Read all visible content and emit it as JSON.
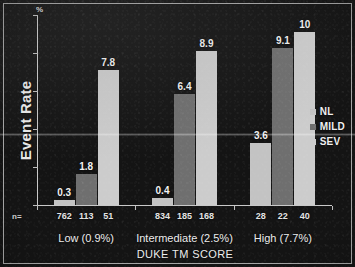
{
  "chart_data": {
    "type": "bar",
    "title": "",
    "xlabel": "DUKE TM SCORE",
    "ylabel": "Event Rate",
    "yunit": "%",
    "categories": [
      "Low (0.9%)",
      "Intermediate (2.5%)",
      "High (7.7%)"
    ],
    "series": [
      {
        "name": "NL",
        "values": [
          0.3,
          0.4,
          3.6
        ],
        "color": "#c3c3c3",
        "counts": [
          762,
          834,
          28
        ]
      },
      {
        "name": "MILD",
        "values": [
          1.8,
          6.4,
          9.1
        ],
        "color": "#6f6f6f",
        "counts": [
          113,
          185,
          22
        ]
      },
      {
        "name": "SEV",
        "values": [
          7.8,
          8.9,
          10
        ],
        "color": "#cccccc",
        "counts": [
          51,
          168,
          40
        ]
      }
    ],
    "value_labels": [
      "0.3",
      "1.8",
      "7.8",
      "0.4",
      "6.4",
      "8.9",
      "3.6",
      "9.1",
      "10"
    ],
    "ylim": [
      0,
      11
    ],
    "grid": false,
    "legend_position": "right",
    "axis_color": "#c9c9c9",
    "background_color": "#141414",
    "text_color": "#ececec"
  },
  "axes": {
    "y_title": "Event Rate",
    "y_unit": "%",
    "x_title": "DUKE TM SCORE"
  },
  "n_row": {
    "label": "n=",
    "groups": [
      {
        "values": [
          "762",
          "113",
          "51"
        ]
      },
      {
        "values": [
          "834",
          "185",
          "168"
        ]
      },
      {
        "values": [
          "28",
          "22",
          "40"
        ]
      }
    ]
  },
  "groups": [
    {
      "label": "Low (0.9%)"
    },
    {
      "label": "Intermediate (2.5%)"
    },
    {
      "label": "High (7.7%)"
    }
  ],
  "legend": {
    "items": [
      {
        "label": "NL",
        "color": "#c3c3c3"
      },
      {
        "label": "MILD",
        "color": "#6f6f6f"
      },
      {
        "label": "SEV",
        "color": "#cccccc"
      }
    ]
  }
}
